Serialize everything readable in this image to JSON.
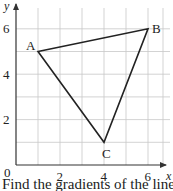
{
  "chart_data": {
    "type": "scatter",
    "title": "",
    "xlabel": "x",
    "ylabel": "y",
    "xlim": [
      0,
      7
    ],
    "ylim": [
      0,
      6.5
    ],
    "x_ticks": [
      "2",
      "4",
      "6"
    ],
    "y_ticks": [
      "2",
      "4",
      "6"
    ],
    "origin_label": "0",
    "grid": true,
    "points": [
      {
        "label": "A",
        "x": 1,
        "y": 5
      },
      {
        "label": "B",
        "x": 6,
        "y": 6
      },
      {
        "label": "C",
        "x": 4,
        "y": 1
      }
    ],
    "shape": "triangle ABC"
  },
  "caption": "Find the gradients of the lines"
}
